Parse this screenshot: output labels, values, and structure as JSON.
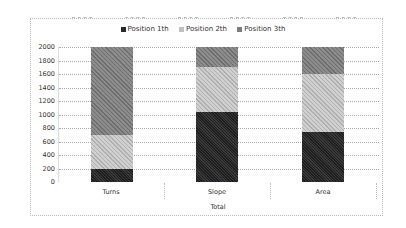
{
  "chart_data": {
    "type": "bar",
    "stacked": true,
    "title": "",
    "categories": [
      "Turns",
      "Slope",
      "Area"
    ],
    "group_label": "Total",
    "series": [
      {
        "name": "Position 1th",
        "values": [
          200,
          1030,
          740
        ],
        "color": "#2a2a2a"
      },
      {
        "name": "Position 2th",
        "values": [
          500,
          670,
          860
        ],
        "color": "#c0c0c0"
      },
      {
        "name": "Position 3th",
        "values": [
          1300,
          300,
          400
        ],
        "color": "#7c7c7c"
      }
    ],
    "xlabel": "Total",
    "ylabel": "",
    "ylim": [
      0,
      2000
    ],
    "yticks": [
      0,
      200,
      400,
      600,
      800,
      1000,
      1200,
      1400,
      1600,
      1800,
      2000
    ],
    "grid": true,
    "legend_position": "top"
  },
  "legend": [
    "Position 1th",
    "Position 2th",
    "Position 3th"
  ],
  "axis": {
    "yticks": [
      "2000",
      "1800",
      "1600",
      "1400",
      "1200",
      "1000",
      "800",
      "600",
      "400",
      "200",
      "0"
    ],
    "categories": [
      "Turns",
      "Slope",
      "Area"
    ],
    "group": "Total"
  }
}
